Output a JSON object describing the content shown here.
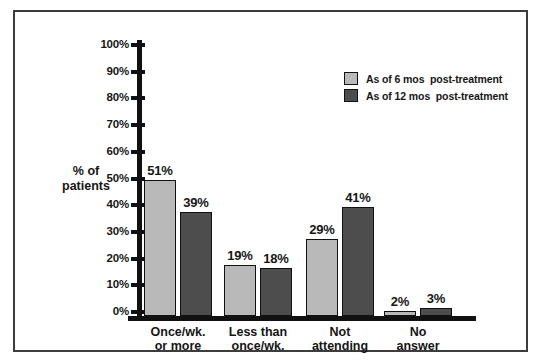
{
  "figure": {
    "background": "#ffffff",
    "frame_border_color": "#3c3c3c",
    "axis_color": "#111111",
    "text_color": "#161616"
  },
  "chart_data": {
    "type": "bar",
    "title": "",
    "xlabel": "",
    "ylabel_lines": [
      "% of",
      "patients"
    ],
    "categories": [
      [
        "Once/wk.",
        "or more"
      ],
      [
        "Less than",
        "once/wk."
      ],
      [
        "Not",
        "attending"
      ],
      [
        "No",
        "answer"
      ]
    ],
    "series": [
      {
        "name": "As of 6 mos  post-treatment",
        "color": "#b9b9b9",
        "values": [
          51,
          19,
          29,
          2
        ]
      },
      {
        "name": "As of 12 mos  post-treatment",
        "color": "#4d4d4d",
        "values": [
          39,
          18,
          41,
          3
        ]
      }
    ],
    "value_label_suffix": "%",
    "y_ticks": [
      "100%",
      "90%",
      "80%",
      "70%",
      "60%",
      "50%",
      "40%",
      "30%",
      "20%",
      "10%",
      "0%"
    ],
    "y_tick_values": [
      100,
      90,
      80,
      70,
      60,
      50,
      40,
      30,
      20,
      10,
      0
    ],
    "ylim": [
      0,
      100
    ],
    "grid": false,
    "legend_position": "upper-right-inside"
  }
}
